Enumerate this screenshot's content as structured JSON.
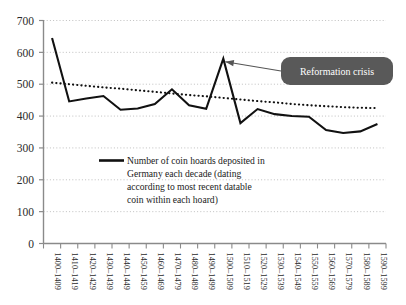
{
  "chart_data": {
    "type": "line",
    "title": "",
    "xlabel": "",
    "ylabel": "",
    "ylim": [
      0,
      700
    ],
    "ytick_step": 100,
    "grid": true,
    "legend_position": "inside-center",
    "categories": [
      "1400–1409",
      "1410–1419",
      "1420–1429",
      "1430–1439",
      "1440–1449",
      "1450–1459",
      "1460–1469",
      "1470–1479",
      "1480–1489",
      "1490–1499",
      "1500–1509",
      "1510–1519",
      "1520–1529",
      "1530–1539",
      "1540–1549",
      "1550–1559",
      "1560–1569",
      "1570–1579",
      "1580–1589",
      "1590–1599"
    ],
    "yticks": [
      0,
      100,
      200,
      300,
      400,
      500,
      600,
      700
    ],
    "series": [
      {
        "name": "Number of coin hoards deposited in Germany each decade (dating according to most recent datable coin within each hoard)",
        "style": "solid",
        "color": "#111111",
        "values": [
          645,
          446,
          455,
          463,
          420,
          424,
          438,
          484,
          434,
          423,
          580,
          378,
          422,
          406,
          400,
          398,
          356,
          347,
          352,
          375
        ]
      },
      {
        "name": "trend",
        "style": "dotted",
        "color": "#111111",
        "values": [
          505,
          500,
          495,
          490,
          486,
          481,
          476,
          471,
          466,
          462,
          457,
          452,
          447,
          443,
          438,
          434,
          431,
          428,
          426,
          425
        ]
      }
    ],
    "annotations": [
      {
        "text": "Reformation crisis",
        "points_to_category": "1500–1509",
        "points_to_value": 580,
        "box_color": "#595959",
        "text_color": "#ffffff"
      }
    ]
  },
  "legend": {
    "swatch": "solid-line-swatch",
    "lines": [
      "Number of coin hoards deposited in",
      "Germany each decade (dating",
      "according to most recent datable",
      "coin within each hoard)"
    ]
  },
  "axes": {
    "y_tick_labels": [
      "700",
      "600",
      "500",
      "400",
      "300",
      "200",
      "100",
      "0"
    ],
    "grid_color": "#b9b9b9",
    "axis_color": "#8a8a8a"
  }
}
